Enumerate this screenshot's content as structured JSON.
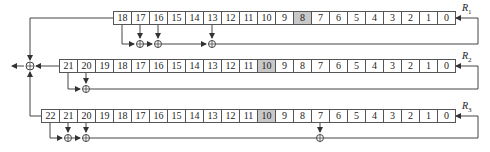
{
  "diagram": {
    "title": "",
    "registers": [
      {
        "name": "R",
        "sub": "1",
        "length": 19,
        "cells": [
          "18",
          "17",
          "16",
          "15",
          "14",
          "13",
          "12",
          "11",
          "10",
          "9",
          "8",
          "7",
          "6",
          "5",
          "4",
          "3",
          "2",
          "1",
          "0"
        ],
        "clock_bit": "8",
        "taps": [
          "18",
          "17",
          "16",
          "13"
        ]
      },
      {
        "name": "R",
        "sub": "2",
        "length": 22,
        "cells": [
          "21",
          "20",
          "19",
          "18",
          "17",
          "16",
          "15",
          "14",
          "13",
          "12",
          "11",
          "10",
          "9",
          "8",
          "7",
          "6",
          "5",
          "4",
          "3",
          "2",
          "1",
          "0"
        ],
        "clock_bit": "10",
        "taps": [
          "21",
          "20"
        ]
      },
      {
        "name": "R",
        "sub": "3",
        "length": 23,
        "cells": [
          "22",
          "21",
          "20",
          "19",
          "18",
          "17",
          "16",
          "15",
          "14",
          "13",
          "12",
          "11",
          "10",
          "9",
          "8",
          "7",
          "6",
          "5",
          "4",
          "3",
          "2",
          "1",
          "0"
        ],
        "clock_bit": "10",
        "taps": [
          "22",
          "21",
          "20",
          "7"
        ]
      }
    ],
    "colors": {
      "line": "#444444",
      "highlight": "#c8c8c8"
    }
  }
}
